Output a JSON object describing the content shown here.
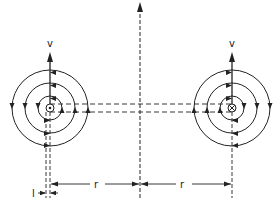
{
  "diagram": {
    "colors": {
      "line": "#222222",
      "background": "#ffffff"
    },
    "left_vortex": {
      "center_symbol": "dot (out of page)",
      "velocity_label": "v",
      "rotation": "counterclockwise"
    },
    "right_vortex": {
      "center_symbol": "cross (into page)",
      "velocity_label": "v",
      "rotation": "clockwise"
    },
    "dimension_labels": {
      "left_r": "r",
      "right_r": "r",
      "core": "l"
    }
  }
}
